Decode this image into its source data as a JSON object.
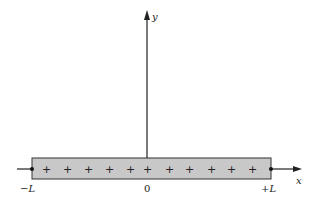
{
  "diagram": {
    "type": "charged-rod-on-axes",
    "axes": {
      "x_label": "x",
      "y_label": "y"
    },
    "rod": {
      "fill_color": "#c8c8c8",
      "stroke_color": "#333333",
      "charges": [
        "+",
        "+",
        "+",
        "+",
        "+",
        "+",
        "+",
        "+",
        "+",
        "+",
        "+",
        "+"
      ],
      "left_end_label": "−L",
      "center_label": "0",
      "right_end_label": "+L"
    }
  }
}
